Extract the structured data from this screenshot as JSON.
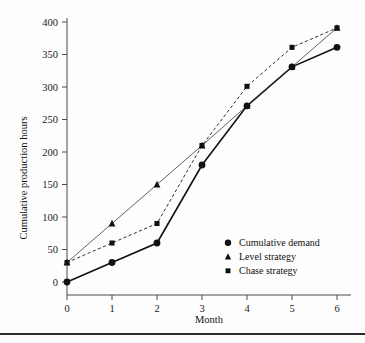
{
  "figure": {
    "background_color": "#fdfdfd",
    "rule_color": "#2b2b2b"
  },
  "chart_data": {
    "type": "line",
    "title": "",
    "xlabel": "Month",
    "ylabel": "Cumulative production hours",
    "x": [
      0,
      1,
      2,
      3,
      4,
      5,
      6
    ],
    "xticklabels": [
      "0",
      "1",
      "2",
      "3",
      "4",
      "5",
      "6"
    ],
    "yticks": [
      0,
      50,
      100,
      150,
      200,
      250,
      300,
      350,
      400
    ],
    "yticklabels": [
      "0",
      "50",
      "100",
      "150",
      "200",
      "250",
      "300",
      "350",
      "400"
    ],
    "xlim": [
      0,
      6
    ],
    "ylim": [
      0,
      400
    ],
    "grid": false,
    "legend_position": "lower right inside",
    "series": [
      {
        "name": "Cumulative demand",
        "marker": "circle",
        "linestyle": "solid",
        "color": "#111111",
        "values": [
          0,
          30,
          60,
          180,
          271,
          331,
          361
        ]
      },
      {
        "name": "Level strategy",
        "marker": "triangle",
        "linestyle": "solid-thin",
        "color": "#3a3a3a",
        "values": [
          30,
          90,
          150,
          210,
          271,
          331,
          391
        ]
      },
      {
        "name": "Chase strategy",
        "marker": "square",
        "linestyle": "dashed",
        "color": "#1a1a1a",
        "values": [
          30,
          60,
          90,
          210,
          301,
          361,
          391
        ]
      }
    ]
  }
}
